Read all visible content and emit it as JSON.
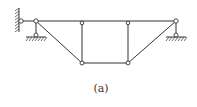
{
  "figure": {
    "caption": "(a)",
    "type": "truss structure diagram",
    "colors": {
      "line": "#333333",
      "node_fill": "#ffffff"
    }
  }
}
